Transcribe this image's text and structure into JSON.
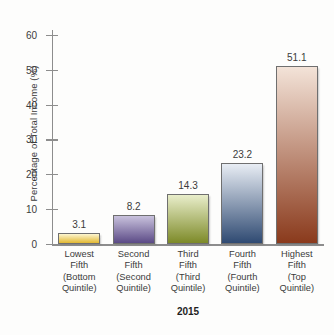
{
  "chart_data": {
    "type": "bar",
    "title": "",
    "xlabel": "2015",
    "ylabel": "Percentage of Total Income (%)",
    "ylim": [
      0,
      62
    ],
    "yticks": [
      0,
      10,
      20,
      30,
      40,
      50,
      60
    ],
    "ytick_labels": [
      "0",
      "10",
      "20",
      "30",
      "40",
      "50",
      "60"
    ],
    "grid": false,
    "legend": false,
    "categories": [
      "Lowest Fifth (Bottom Quintile)",
      "Second Fifth (Second Quintile)",
      "Third Fifth (Third Quintile)",
      "Fourth Fifth (Fourth Quintile)",
      "Highest Fifth (Top Quintile)"
    ],
    "category_lines": [
      [
        "Lowest",
        "Fifth",
        "(Bottom",
        "Quintile)"
      ],
      [
        "Second",
        "Fifth",
        "(Second",
        "Quintile)"
      ],
      [
        "Third",
        "Fifth",
        "(Third",
        "Quintile)"
      ],
      [
        "Fourth",
        "Fifth",
        "(Fourth",
        "Quintile)"
      ],
      [
        "Highest",
        "Fifth",
        "(Top",
        "Quintile)"
      ]
    ],
    "values": [
      3.1,
      8.2,
      14.3,
      23.2,
      51.1
    ],
    "value_labels": [
      "3.1",
      "8.2",
      "14.3",
      "23.2",
      "51.1"
    ],
    "bar_colors_top": [
      "#fdf6d0",
      "#c9c2dd",
      "#e9eecb",
      "#e8edf4",
      "#f3e3d8"
    ],
    "bar_colors_bottom": [
      "#e2b832",
      "#5b4a86",
      "#7d8a28",
      "#2f4a72",
      "#8a3a1c"
    ],
    "bar_border_color": "#6f6f6f",
    "axis_color": "#8d8d8d",
    "text_color": "#3b3b3b"
  }
}
